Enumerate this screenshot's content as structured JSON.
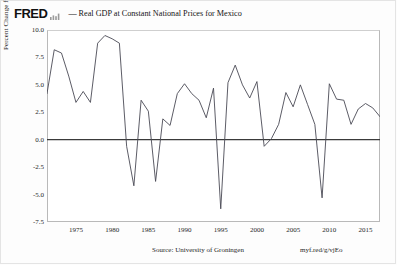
{
  "header": {
    "brand": "FRED",
    "spark_icon": "sparkline-icon",
    "legend_dash": "—",
    "series_title": "Real GDP at Constant National Prices for Mexico"
  },
  "axes": {
    "ylabel": "Percent Change from Year Ago",
    "yticks": [
      "10.0",
      "7.5",
      "5.0",
      "2.5",
      "0.0",
      "-2.5",
      "-5.0",
      "-7.5"
    ],
    "ytick_values": [
      10.0,
      7.5,
      5.0,
      2.5,
      0.0,
      -2.5,
      -5.0,
      -7.5
    ],
    "xticks": [
      "1975",
      "1980",
      "1985",
      "1990",
      "1995",
      "2000",
      "2005",
      "2010",
      "2015"
    ],
    "xtick_values": [
      1975,
      1980,
      1985,
      1990,
      1995,
      2000,
      2005,
      2010,
      2015
    ]
  },
  "footer": {
    "source": "Source: University of Groningen",
    "short_url": "myf.red/g/vjEo"
  },
  "colors": {
    "line": "#4a4a55",
    "zero_line": "#3a3a3a",
    "frame": "#b9b9b9",
    "background": "#ffffff",
    "text": "#1f1f1f"
  },
  "chart_data": {
    "type": "line",
    "title": "Real GDP at Constant National Prices for Mexico",
    "xlabel": "",
    "ylabel": "Percent Change from Year Ago",
    "xlim": [
      1971,
      2017
    ],
    "ylim": [
      -7.5,
      10.0
    ],
    "grid": false,
    "legend_position": "top",
    "zero_reference_line": 0.0,
    "series": [
      {
        "name": "Real GDP at Constant National Prices for Mexico",
        "x": [
          1971,
          1972,
          1973,
          1974,
          1975,
          1976,
          1977,
          1978,
          1979,
          1980,
          1981,
          1982,
          1983,
          1984,
          1985,
          1986,
          1987,
          1988,
          1989,
          1990,
          1991,
          1992,
          1993,
          1994,
          1995,
          1996,
          1997,
          1998,
          1999,
          2000,
          2001,
          2002,
          2003,
          2004,
          2005,
          2006,
          2007,
          2008,
          2009,
          2010,
          2011,
          2012,
          2013,
          2014,
          2015,
          2016,
          2017
        ],
        "values": [
          4.2,
          8.2,
          7.9,
          5.8,
          3.4,
          4.4,
          3.4,
          8.8,
          9.5,
          9.2,
          8.8,
          -0.6,
          -4.2,
          3.6,
          2.6,
          -3.8,
          1.9,
          1.3,
          4.2,
          5.1,
          4.2,
          3.6,
          2.0,
          4.7,
          -6.3,
          5.2,
          6.8,
          5.0,
          3.8,
          5.3,
          -0.6,
          0.1,
          1.4,
          4.3,
          3.0,
          5.0,
          3.2,
          1.4,
          -5.3,
          5.1,
          3.7,
          3.6,
          1.4,
          2.8,
          3.3,
          2.9,
          2.1
        ]
      }
    ]
  }
}
